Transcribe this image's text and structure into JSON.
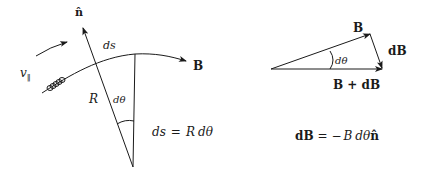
{
  "left_figure": {
    "labels": {
      "normal_vector": "n̂",
      "arc_length": "ds",
      "field": "B",
      "radius": "R",
      "angle": "dθ",
      "parallel_velocity": "v",
      "parallel_subscript": "‖"
    },
    "equation": {
      "lhs": "ds",
      "eq": "=",
      "rhs_r": "R",
      "rhs_dtheta": "dθ"
    }
  },
  "right_figure": {
    "labels": {
      "field": "B",
      "field_change": "dB",
      "angle": "dθ",
      "sum": "B + dB"
    },
    "equation": {
      "lhs": "dB",
      "eq": "= −",
      "rhs_b": "B",
      "rhs_dtheta": "dθ",
      "rhs_n": "n̂"
    }
  },
  "colors": {
    "ink": "#1a1a1a",
    "background": "#ffffff"
  }
}
